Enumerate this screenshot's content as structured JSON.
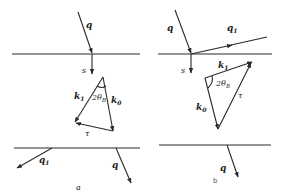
{
  "figure": {
    "panel_a": {
      "caption": "a",
      "labels": {
        "q_in": "q",
        "s": "s",
        "k1": "k",
        "k1_sub": "1",
        "k0": "k",
        "k0_sub": "0",
        "angle": "2θ",
        "angle_sub": "B",
        "tau": "τ",
        "q1_out": "q",
        "q1_sub": "1",
        "q_out": "q"
      }
    },
    "panel_b": {
      "caption": "b",
      "labels": {
        "q_in": "q",
        "q1": "q",
        "q1_sub": "1",
        "s": "s",
        "k1": "k",
        "k1_sub": "1",
        "k0": "k",
        "k0_sub": "0",
        "angle": "2θ",
        "angle_sub": "B",
        "tau": "τ",
        "q_out": "q"
      }
    },
    "colors": {
      "line": "#2a2a2a",
      "text": "#222222",
      "background": "#ffffff"
    }
  }
}
